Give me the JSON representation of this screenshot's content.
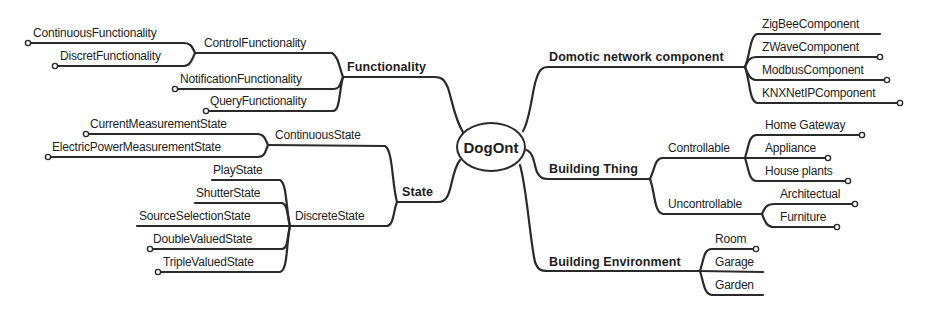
{
  "diagram": {
    "type": "mind-map",
    "root": "DogOnt",
    "left_branches": {
      "functionality": {
        "label": "Functionality",
        "children": {
          "control": {
            "label": "ControlFunctionality",
            "children": [
              "ContinuousFunctionality",
              "DiscretFunctionality"
            ]
          },
          "notification": "NotificationFunctionality",
          "query": "QueryFunctionality"
        }
      },
      "state": {
        "label": "State",
        "children": {
          "continuous": {
            "label": "ContinuousState",
            "children": [
              "CurrentMeasurementState",
              "ElectricPowerMeasurementState"
            ]
          },
          "discrete": {
            "label": "DiscreteState",
            "children": [
              "PlayState",
              "ShutterState",
              "SourceSelectionState",
              "DoubleValuedState",
              "TripleValuedState"
            ]
          }
        }
      }
    },
    "right_branches": {
      "domotic": {
        "label": "Domotic network component",
        "children": [
          "ZigBeeComponent",
          "ZWaveComponent",
          "ModbusComponent",
          "KNXNetIPComponent"
        ]
      },
      "building_thing": {
        "label": "Building Thing",
        "children": {
          "controllable": {
            "label": "Controllable",
            "children": [
              "Home Gateway",
              "Appliance",
              "House plants"
            ]
          },
          "uncontrollable": {
            "label": "Uncontrollable",
            "children": [
              "Architectual",
              "Furniture"
            ]
          }
        }
      },
      "building_environment": {
        "label": "Building Environment",
        "children": [
          "Room",
          "Garage",
          "Garden"
        ]
      }
    },
    "colors": {
      "line": "#2a2a2a",
      "text": "#1e1e1e",
      "background": "#ffffff"
    }
  }
}
